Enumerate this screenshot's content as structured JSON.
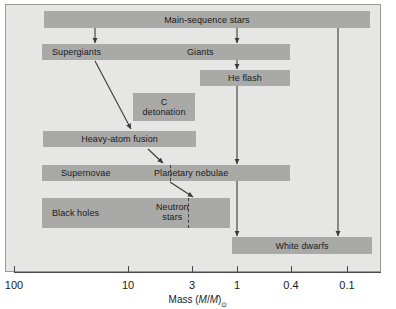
{
  "figure": {
    "background_color": "#e6e6e4",
    "bar_color": "#a9a9a7",
    "line_color": "#3a3a3a"
  },
  "axis": {
    "label_prefix": "Mass (",
    "label_m1": "M",
    "label_slash": "/",
    "label_m2": "M",
    "label_suffix": ")",
    "solar_symbol": "⊙",
    "full_label": "Mass (M/M)⊙",
    "scale": "log-reverse",
    "ticks": [
      {
        "label": "100",
        "x": 14
      },
      {
        "label": "10",
        "x": 128
      },
      {
        "label": "3",
        "x": 192
      },
      {
        "label": "1",
        "x": 237
      },
      {
        "label": "0.4",
        "x": 291
      },
      {
        "label": "0.1",
        "x": 347
      }
    ]
  },
  "stages": [
    {
      "name": "main-sequence-stars",
      "label": "Main-sequence stars",
      "x": 44,
      "y": 11,
      "w": 326,
      "h": 17,
      "label_offset_x": 163,
      "lines": 1
    },
    {
      "name": "supergiants-giants",
      "label_left": "Supergiants",
      "label_right": "Giants",
      "x": 42,
      "y": 44,
      "w": 248,
      "h": 16,
      "label_left_x": 52,
      "label_right_x": 187,
      "lines": 1
    },
    {
      "name": "he-flash",
      "label": "He flash",
      "x": 200,
      "y": 70,
      "w": 90,
      "h": 16,
      "label_offset_x": 45,
      "lines": 1
    },
    {
      "name": "c-detonation",
      "label": "C detonation",
      "label_line1": "C",
      "label_line2": "detonation",
      "x": 133,
      "y": 93,
      "w": 62,
      "h": 28,
      "label_offset_x": 31,
      "lines": 2
    },
    {
      "name": "heavy-atom-fusion",
      "label": "Heavy-atom fusion",
      "x": 43,
      "y": 131,
      "w": 153,
      "h": 16,
      "label_offset_x": 76,
      "lines": 1
    },
    {
      "name": "supernovae-planetary-nebulae",
      "label_left": "Supernovae",
      "label_right": "Planetary nebulae",
      "x": 42,
      "y": 165,
      "w": 248,
      "h": 16,
      "label_left_x": 61,
      "label_right_x": 154,
      "divider_x": 170,
      "lines": 1
    },
    {
      "name": "black-holes-neutron-stars",
      "label_left": "Black holes",
      "label_right_line1": "Neutron",
      "label_right_line2": "stars",
      "x": 42,
      "y": 198,
      "w": 188,
      "h": 30,
      "label_left_x": 52,
      "label_right_x": 156,
      "divider_x": 188,
      "lines": 2
    },
    {
      "name": "white-dwarfs",
      "label": "White dwarfs",
      "x": 232,
      "y": 237,
      "w": 140,
      "h": 17,
      "label_offset_x": 70,
      "lines": 1
    }
  ],
  "arrows": [
    {
      "name": "main-sequence-to-supergiants",
      "x1": 95,
      "y1": 28,
      "x2": 95,
      "y2": 43,
      "style": "straight"
    },
    {
      "name": "main-sequence-to-giants",
      "x1": 237,
      "y1": 28,
      "x2": 237,
      "y2": 43,
      "style": "straight"
    },
    {
      "name": "main-sequence-to-white-dwarfs",
      "x1": 338,
      "y1": 28,
      "x2": 338,
      "y2": 236,
      "style": "straight"
    },
    {
      "name": "giants-to-he-flash",
      "x1": 237,
      "y1": 60,
      "x2": 237,
      "y2": 69,
      "style": "straight"
    },
    {
      "name": "he-flash-to-planetary-nebulae",
      "x1": 237,
      "y1": 86,
      "x2": 237,
      "y2": 164,
      "style": "straight"
    },
    {
      "name": "planetary-nebulae-to-white-dwarfs",
      "x1": 237,
      "y1": 181,
      "x2": 237,
      "y2": 236,
      "style": "straight"
    },
    {
      "name": "supergiants-to-heavy-atom-fusion",
      "x1": 95,
      "y1": 61,
      "x2": 131,
      "y2": 129,
      "style": "diagonal"
    },
    {
      "name": "heavy-atom-fusion-to-supernovae",
      "x1": 148,
      "y1": 149,
      "x2": 163,
      "y2": 163,
      "style": "diagonal"
    },
    {
      "name": "supernovae-to-neutron-stars",
      "x1": 170,
      "y1": 182,
      "x2": 193,
      "y2": 197,
      "style": "diagonal"
    }
  ]
}
